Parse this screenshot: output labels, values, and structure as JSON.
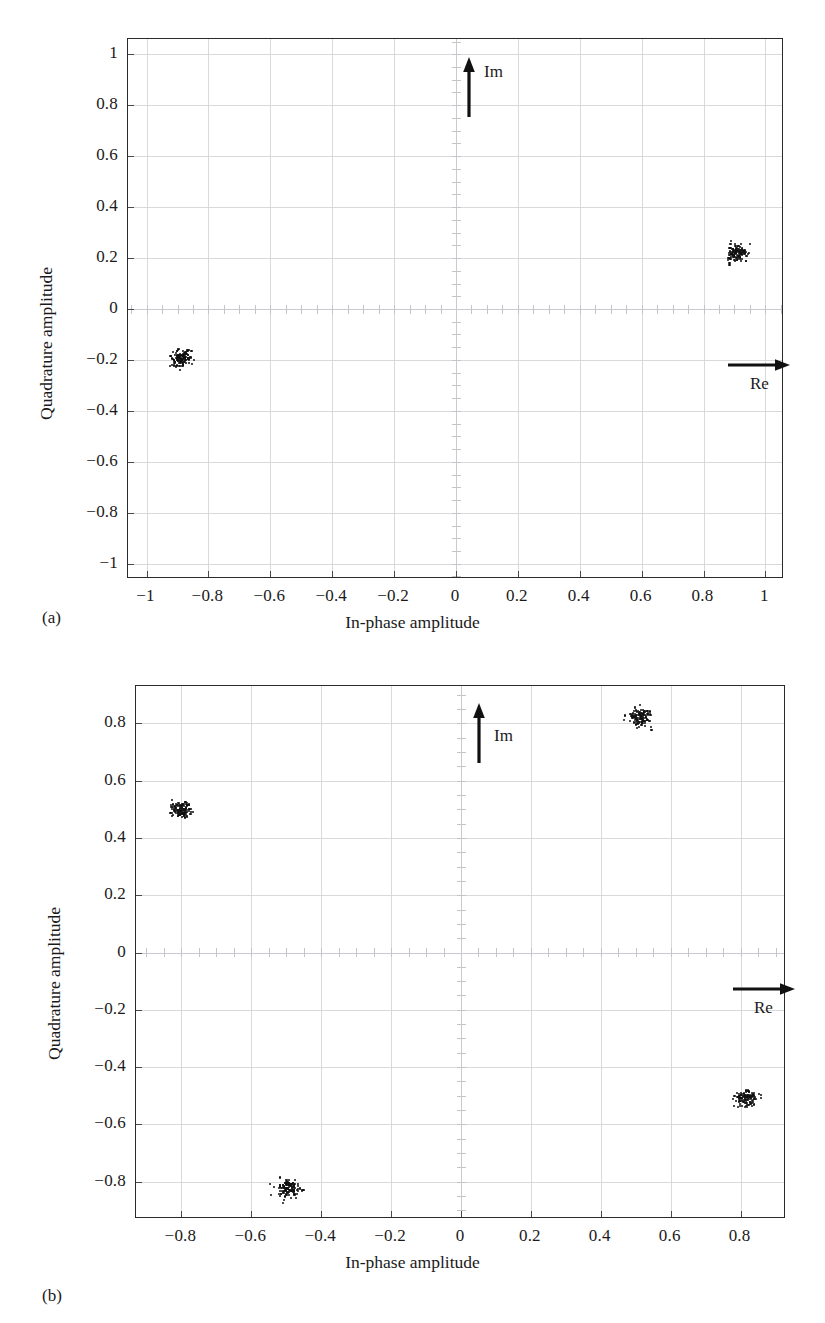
{
  "figure": {
    "background": "#ffffff",
    "axis_color": "#2b2b2b",
    "grid_color": "#d9d9dc",
    "marker_color": "#111111"
  },
  "panels": [
    {
      "id": "a",
      "sublabel": "(a)",
      "annotations": {
        "imag_label": "Im",
        "real_label": "Re"
      },
      "chart_data": {
        "type": "scatter",
        "title": "",
        "xlabel": "In-phase amplitude",
        "ylabel": "Quadrature amplitude",
        "xlim": [
          -1.06,
          1.06
        ],
        "ylim": [
          -1.06,
          1.06
        ],
        "xticks": [
          -1,
          -0.8,
          -0.6,
          -0.4,
          -0.2,
          0,
          0.2,
          0.4,
          0.6,
          0.8,
          1
        ],
        "yticks": [
          -1,
          -0.8,
          -0.6,
          -0.4,
          -0.2,
          0,
          0.2,
          0.4,
          0.6,
          0.8,
          1
        ],
        "xticklabels": [
          "-1",
          "-0.8",
          "-0.6",
          "-0.4",
          "-0.2",
          "0",
          "0.2",
          "0.4",
          "0.6",
          "0.8",
          "1"
        ],
        "yticklabels": [
          "-1",
          "-0.8",
          "-0.6",
          "-0.4",
          "-0.2",
          "0",
          "0.2",
          "0.4",
          "0.6",
          "0.8",
          "1"
        ],
        "grid": true,
        "legend": "none",
        "series": [
          {
            "name": "BPSK constellation",
            "points": [
              {
                "x": 0.905,
                "y": 0.222
              },
              {
                "x": -0.893,
                "y": -0.19
              }
            ],
            "cluster_spread": 0.018
          }
        ]
      }
    },
    {
      "id": "b",
      "sublabel": "(b)",
      "annotations": {
        "imag_label": "Im",
        "real_label": "Re"
      },
      "chart_data": {
        "type": "scatter",
        "title": "",
        "xlabel": "In-phase amplitude",
        "ylabel": "Quadrature amplitude",
        "xlim": [
          -0.93,
          0.93
        ],
        "ylim": [
          -0.93,
          0.93
        ],
        "xticks": [
          -0.8,
          -0.6,
          -0.4,
          -0.2,
          0,
          0.2,
          0.4,
          0.6,
          0.8
        ],
        "yticks": [
          -0.8,
          -0.6,
          -0.4,
          -0.2,
          0,
          0.2,
          0.4,
          0.6,
          0.8
        ],
        "xticklabels": [
          "-0.8",
          "-0.6",
          "-0.4",
          "-0.2",
          "0",
          "0.2",
          "0.4",
          "0.6",
          "0.8"
        ],
        "yticklabels": [
          "-0.8",
          "-0.6",
          "-0.4",
          "-0.2",
          "0",
          "0.2",
          "0.4",
          "0.6",
          "0.8"
        ],
        "grid": true,
        "legend": "none",
        "series": [
          {
            "name": "QPSK constellation",
            "points": [
              {
                "x": 0.51,
                "y": 0.825
              },
              {
                "x": -0.805,
                "y": 0.505
              },
              {
                "x": 0.815,
                "y": -0.505
              },
              {
                "x": -0.498,
                "y": -0.818
              }
            ],
            "cluster_spread": 0.016
          }
        ]
      }
    }
  ]
}
